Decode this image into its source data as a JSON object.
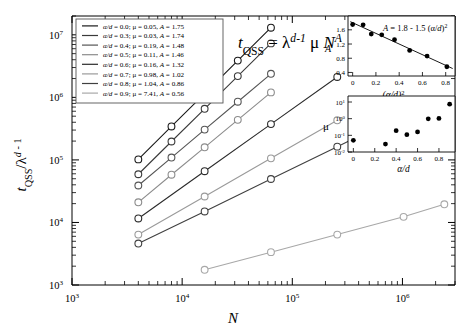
{
  "chart_data": {
    "type": "scatter",
    "title": "",
    "annotation_formula": "t_QSS = λ^{d-1} μ N^{A}",
    "xlabel": "N",
    "ylabel": "t_QSS/λ^{d-1}",
    "xscale": "log",
    "yscale": "log",
    "xlim": [
      1000,
      3000000
    ],
    "ylim": [
      1000,
      20000000
    ],
    "xticks": [
      "10^3",
      "10^4",
      "10^5",
      "10^6"
    ],
    "yticks": [
      "10^3",
      "10^4",
      "10^5",
      "10^6",
      "10^7"
    ],
    "grid": false,
    "legend_position": "upper-left",
    "marker": "open-circle",
    "series": [
      {
        "name": "α/d = 0.0; μ = 0.05; A = 1.75",
        "alpha_d": 0.0,
        "mu": 0.05,
        "A": 1.75,
        "color": "#1a1a1a",
        "x": [
          4000,
          8000,
          16000,
          32000,
          64000
        ],
        "y": [
          102000,
          343000,
          1150000,
          3870000,
          13000000
        ]
      },
      {
        "name": "α/d = 0.3; μ = 0.03; A = 1.74",
        "alpha_d": 0.3,
        "mu": 0.03,
        "A": 1.74,
        "color": "#3a3a3a",
        "x": [
          4000,
          8000,
          16000,
          32000,
          64000
        ],
        "y": [
          59000,
          197000,
          657000,
          2190000,
          7300000
        ]
      },
      {
        "name": "α/d = 0.4; μ = 0.19; A = 1.48",
        "alpha_d": 0.4,
        "mu": 0.19,
        "A": 1.48,
        "color": "#555555",
        "x": [
          4000,
          8000,
          16000,
          32000,
          64000
        ],
        "y": [
          39000,
          109000,
          305000,
          852000,
          2380000
        ]
      },
      {
        "name": "α/d = 0.5; μ = 0.11; A = 1.46",
        "alpha_d": 0.5,
        "mu": 0.11,
        "A": 1.46,
        "color": "#8c8c8c",
        "x": [
          4000,
          8000,
          16000,
          32000,
          64000
        ],
        "y": [
          21000,
          58000,
          159000,
          437000,
          1200000
        ]
      },
      {
        "name": "α/d = 0.6; μ = 0.16; A = 1.32",
        "alpha_d": 0.6,
        "mu": 0.16,
        "A": 1.32,
        "color": "#2b2b2b",
        "x": [
          4000,
          16000,
          64000,
          256000
        ],
        "y": [
          11600,
          66000,
          374000,
          2120000
        ]
      },
      {
        "name": "α/d = 0.7; μ = 0.98; A = 1.02",
        "alpha_d": 0.7,
        "mu": 0.98,
        "A": 1.02,
        "color": "#9a9a9a",
        "x": [
          4000,
          16000,
          64000,
          256000
        ],
        "y": [
          6400,
          26000,
          106000,
          430000
        ]
      },
      {
        "name": "α/d = 0.8; μ = 1.04; A = 0.86",
        "alpha_d": 0.8,
        "mu": 1.04,
        "A": 0.86,
        "color": "#404040",
        "x": [
          4000,
          16000,
          64000,
          256000,
          1024000
        ],
        "y": [
          4600,
          15000,
          49500,
          163000,
          540000
        ]
      },
      {
        "name": "α/d = 0.9; μ = 7.41; A = 0.56",
        "alpha_d": 0.9,
        "mu": 7.41,
        "A": 0.56,
        "color": "#a8a8a8",
        "x": [
          16000,
          64000,
          256000,
          1024000,
          2400000
        ],
        "y": [
          1750,
          3350,
          6400,
          12300,
          19500
        ]
      }
    ],
    "inset_top": {
      "type": "scatter",
      "xlabel": "(α/d)^2",
      "ylabel": "A",
      "fit_label": "A = 1.8 - 1.5 (α/d)²",
      "fit_intercept": 1.8,
      "fit_slope": -1.5,
      "xlim": [
        -0.04,
        0.88
      ],
      "ylim": [
        0.3,
        1.82
      ],
      "xticks": [
        "0",
        "0.2",
        "0.4",
        "0.6",
        "0.8"
      ],
      "xtick_values": [
        0,
        0.2,
        0.4,
        0.6,
        0.8
      ],
      "yticks": [
        "0.4",
        "0.8",
        "1.2",
        "1.6"
      ],
      "ytick_values": [
        0.4,
        0.8,
        1.2,
        1.6
      ],
      "marker": "filled-circle",
      "x": [
        0.0,
        0.09,
        0.16,
        0.25,
        0.36,
        0.49,
        0.64,
        0.81
      ],
      "y": [
        1.75,
        1.74,
        1.48,
        1.46,
        1.32,
        1.02,
        0.86,
        0.56
      ]
    },
    "inset_bottom": {
      "type": "scatter",
      "xlabel": "α/d",
      "ylabel": "μ",
      "yscale": "log",
      "xlim": [
        -0.05,
        0.95
      ],
      "ylim": [
        0.01,
        10
      ],
      "xticks": [
        "0",
        "0.2",
        "0.4",
        "0.6",
        "0.8"
      ],
      "xtick_values": [
        0,
        0.2,
        0.4,
        0.6,
        0.8
      ],
      "yticks": [
        "10^-2",
        "10^-1",
        "10^0",
        "10^1"
      ],
      "marker": "filled-circle",
      "x": [
        0.0,
        0.3,
        0.4,
        0.5,
        0.6,
        0.7,
        0.8,
        0.9
      ],
      "y": [
        0.05,
        0.03,
        0.19,
        0.11,
        0.16,
        0.98,
        1.04,
        7.41
      ]
    }
  }
}
